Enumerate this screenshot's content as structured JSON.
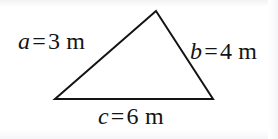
{
  "figure": {
    "name": "triangle-with-labeled-sides",
    "background_color": "#ffffff",
    "stroke_color": "#141414",
    "stroke_width": 2,
    "shape": {
      "type": "triangle",
      "filled": false,
      "vertices": [
        {
          "name": "apex",
          "x": 156,
          "y": 11
        },
        {
          "name": "bottom-right",
          "x": 213,
          "y": 99
        },
        {
          "name": "bottom-left",
          "x": 55,
          "y": 99
        }
      ],
      "points_attr": "156,11 213,99 55,99"
    },
    "labels": {
      "a": {
        "symbol": "a",
        "equals": "=",
        "value": "3",
        "unit": "m",
        "full_text": "a = 3 m",
        "position": "upper-left"
      },
      "b": {
        "symbol": "b",
        "equals": "=",
        "value": "4",
        "unit": "m",
        "full_text": "b = 4 m",
        "position": "right"
      },
      "c": {
        "symbol": "c",
        "equals": "=",
        "value": "6",
        "unit": "m",
        "full_text": "c = 6 m",
        "position": "bottom-center"
      }
    }
  }
}
